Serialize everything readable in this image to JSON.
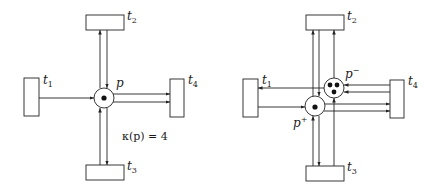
{
  "left_net": {
    "transitions": [
      {
        "id": "t1",
        "label": "t",
        "sub": "1"
      },
      {
        "id": "t2",
        "label": "t",
        "sub": "2"
      },
      {
        "id": "t3",
        "label": "t",
        "sub": "3"
      },
      {
        "id": "t4",
        "label": "t",
        "sub": "4"
      }
    ],
    "place": {
      "label": "p",
      "tokens": 1
    },
    "capacity_label": "κ(p) = 4"
  },
  "right_net": {
    "transitions": [
      {
        "id": "t1",
        "label": "t",
        "sub": "1"
      },
      {
        "id": "t2",
        "label": "t",
        "sub": "2"
      },
      {
        "id": "t3",
        "label": "t",
        "sub": "3"
      },
      {
        "id": "t4",
        "label": "t",
        "sub": "4"
      }
    ],
    "places": [
      {
        "id": "p_plus",
        "label": "p",
        "sup": "+",
        "tokens": 1
      },
      {
        "id": "p_minus",
        "label": "p",
        "sup": "−",
        "tokens": 3
      }
    ]
  },
  "colors": {
    "stroke": "#222222",
    "background": "#ffffff"
  }
}
